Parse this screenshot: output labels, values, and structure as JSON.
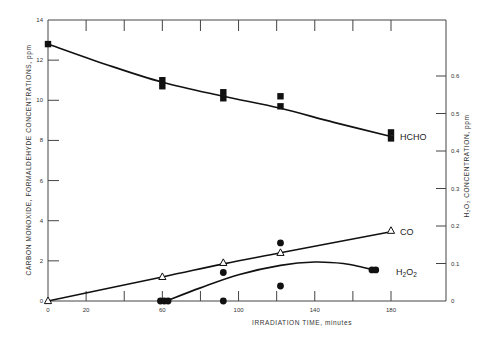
{
  "chart_data": {
    "type": "line",
    "title": "",
    "xlabel": "IRRADIATION TIME, minutes",
    "ylabel": "CARBON MONOXIDE, FORMALDEHYDE CONCENTRATIONS, ppm",
    "y2label": "H2O2 CONCENTRATION, ppm",
    "xlim": [
      0,
      200
    ],
    "ylim": [
      0,
      14
    ],
    "y2lim": [
      0,
      0.7
    ],
    "xticks": [
      0,
      20,
      40,
      60,
      80,
      100,
      120,
      140,
      160,
      180
    ],
    "xtick_labels": [
      "0",
      "20",
      "",
      "60",
      "",
      "100",
      "",
      "140",
      "",
      "180"
    ],
    "yticks": [
      0,
      2,
      4,
      6,
      8,
      10,
      12,
      14
    ],
    "ytick_labels": [
      "0",
      "2",
      "4",
      "6",
      "8",
      "10",
      "12",
      "14"
    ],
    "y2ticks": [
      0,
      0.1,
      0.2,
      0.3,
      0.4,
      0.5,
      0.6
    ],
    "y2tick_labels": [
      "0",
      "0.1",
      "0.2",
      "0.3",
      "0.4",
      "0.5",
      "0.6"
    ],
    "grid": false,
    "legend": "inline labels at right end of curves",
    "series": [
      {
        "name": "HCHO",
        "axis": "left",
        "marker": "filled-square",
        "points": [
          [
            0,
            12.8
          ],
          [
            60,
            11.0
          ],
          [
            60,
            10.7
          ],
          [
            92,
            10.4
          ],
          [
            92,
            10.1
          ],
          [
            122,
            10.2
          ],
          [
            122,
            9.7
          ],
          [
            180,
            8.4
          ],
          [
            180,
            8.1
          ]
        ],
        "fit_curve": [
          [
            0,
            12.8
          ],
          [
            30,
            11.8
          ],
          [
            60,
            10.9
          ],
          [
            92,
            10.2
          ],
          [
            122,
            9.6
          ],
          [
            150,
            8.9
          ],
          [
            180,
            8.2
          ]
        ]
      },
      {
        "name": "CO",
        "axis": "left",
        "marker": "open-triangle",
        "points": [
          [
            0,
            0
          ],
          [
            60,
            1.2
          ],
          [
            92,
            1.9
          ],
          [
            122,
            2.4
          ],
          [
            180,
            3.5
          ]
        ],
        "fit_curve": [
          [
            0,
            0
          ],
          [
            60,
            1.2
          ],
          [
            92,
            1.85
          ],
          [
            122,
            2.4
          ],
          [
            180,
            3.45
          ]
        ]
      },
      {
        "name": "H2O2",
        "axis": "right",
        "marker": "filled-circle",
        "points": [
          [
            59,
            0
          ],
          [
            61,
            0
          ],
          [
            63,
            0
          ],
          [
            92,
            0.076
          ],
          [
            92,
            0
          ],
          [
            122,
            0.155
          ],
          [
            122,
            0.04
          ],
          [
            170,
            0.083
          ],
          [
            172,
            0.083
          ]
        ],
        "fit_curve": [
          [
            62,
            0
          ],
          [
            80,
            0.035
          ],
          [
            100,
            0.07
          ],
          [
            122,
            0.095
          ],
          [
            140,
            0.104
          ],
          [
            155,
            0.1
          ],
          [
            165,
            0.09
          ],
          [
            171,
            0.083
          ]
        ]
      }
    ]
  },
  "labels": {
    "x_axis_title": "IRRADIATION TIME, minutes",
    "y_left_title": "CARBON MONOXIDE, FORMALDEHYDE CONCENTRATIONS, ppm",
    "y_right_title": "H₂O₂ CONCENTRATION, ppm",
    "series_hcho": "HCHO",
    "series_co": "CO",
    "series_h2o2_main": "H",
    "series_h2o2_sub1": "2",
    "series_h2o2_mid": "O",
    "series_h2o2_sub2": "2"
  }
}
